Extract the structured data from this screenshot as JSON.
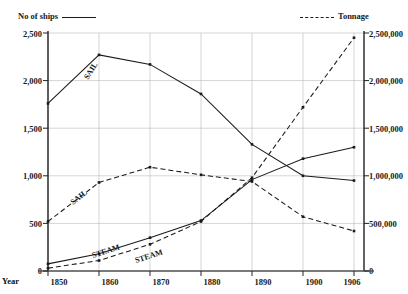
{
  "legend": {
    "left": {
      "text": "No of ships",
      "style": "solid",
      "icon": "solid-line-icon"
    },
    "right": {
      "text": "Tonnage",
      "style": "dashed",
      "icon": "dashed-line-icon"
    }
  },
  "axes": {
    "x_caption": "Year",
    "x_ticks": [
      "1850",
      "1860",
      "1870",
      "1880",
      "1890",
      "1900",
      "1906"
    ],
    "y_left_ticks": [
      "0",
      "500",
      "1,000",
      "1,500",
      "2,000",
      "2,500"
    ],
    "y_right_ticks": [
      "0",
      "500,000",
      "1,000,000",
      "1,500,000",
      "2,000,000",
      "2,500,000"
    ]
  },
  "series_labels": {
    "sail_ships": "SAIL",
    "sail_tonnage": "SAIL",
    "steam_ships": "STEAM",
    "steam_tonnage": "STEAM"
  },
  "chart_data": {
    "type": "line",
    "title": "",
    "xlabel": "Year",
    "ylabel": "No of ships",
    "y2label": "Tonnage",
    "x": [
      1850,
      1860,
      1870,
      1880,
      1890,
      1900,
      1906
    ],
    "xlim": [
      1850,
      1906
    ],
    "ylim": [
      0,
      2500
    ],
    "y2lim": [
      0,
      2500000
    ],
    "grid": true,
    "legend_position": "top",
    "series": [
      {
        "name": "SAIL",
        "axis": "left",
        "unit": "No of ships",
        "style": "solid",
        "label": "SAIL",
        "values": [
          1760,
          2270,
          2170,
          1860,
          1330,
          1000,
          950
        ]
      },
      {
        "name": "STEAM",
        "axis": "left",
        "unit": "No of ships",
        "style": "solid",
        "label": "STEAM",
        "values": [
          75,
          180,
          350,
          530,
          960,
          1180,
          1300
        ]
      },
      {
        "name": "SAIL",
        "axis": "right",
        "unit": "Tonnage",
        "style": "dashed",
        "label": "SAIL",
        "values": [
          520000,
          930000,
          1090000,
          1010000,
          940000,
          570000,
          420000
        ]
      },
      {
        "name": "STEAM",
        "axis": "right",
        "unit": "Tonnage",
        "style": "dashed",
        "label": "STEAM",
        "values": [
          30000,
          110000,
          280000,
          520000,
          980000,
          1720000,
          2450000
        ]
      }
    ]
  }
}
